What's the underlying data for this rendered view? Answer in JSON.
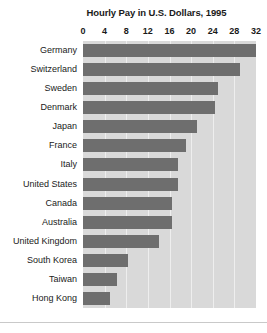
{
  "chart_data": {
    "type": "bar",
    "orientation": "horizontal",
    "title": "Hourly Pay in U.S. Dollars, 1995",
    "xlabel": "",
    "ylabel": "",
    "xlim": [
      0,
      32
    ],
    "xticks": [
      0,
      4,
      8,
      12,
      16,
      20,
      24,
      28,
      32
    ],
    "grid": true,
    "legend": "none",
    "bar_color": "#6e6e6e",
    "plot_background": "#d9d9d9",
    "categories": [
      "Germany",
      "Switzerland",
      "Sweden",
      "Denmark",
      "Japan",
      "France",
      "Italy",
      "United States",
      "Canada",
      "Australia",
      "United Kingdom",
      "South Korea",
      "Taiwan",
      "Hong Kong"
    ],
    "values": [
      32,
      29,
      25,
      24.5,
      21,
      19,
      17.5,
      17.5,
      16.5,
      16.5,
      14,
      8.3,
      6.3,
      5
    ]
  }
}
